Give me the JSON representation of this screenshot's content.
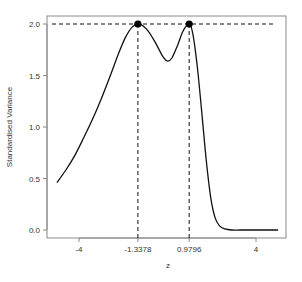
{
  "chart_data": {
    "type": "line",
    "title": "",
    "xlabel": "z",
    "ylabel": "Standardised Variance",
    "xlim": [
      -5.5,
      5.4
    ],
    "ylim": [
      -0.08,
      2.08
    ],
    "x_ticks": [
      -4,
      -1.3378,
      0.9796,
      4
    ],
    "x_tick_labels": [
      "-4",
      "-1.3378",
      "0.9796",
      "4"
    ],
    "y_ticks": [
      0.0,
      0.5,
      1.0,
      1.5,
      2.0
    ],
    "y_tick_labels": [
      "0.0",
      "0.5",
      "1.0",
      "1.5",
      "2.0"
    ],
    "grid": false,
    "legend": null,
    "series": [
      {
        "name": "Standardised Variance",
        "x": [
          -5.0,
          -4.6,
          -4.2,
          -3.8,
          -3.4,
          -3.0,
          -2.6,
          -2.2,
          -1.9,
          -1.6,
          -1.3378,
          -1.1,
          -0.8,
          -0.5,
          -0.2,
          0.0,
          0.2,
          0.45,
          0.7,
          0.9796,
          1.15,
          1.35,
          1.55,
          1.75,
          1.95,
          2.15,
          2.35,
          2.6,
          2.9,
          3.3,
          4.0,
          4.6,
          5.0
        ],
        "y": [
          0.46,
          0.58,
          0.72,
          0.89,
          1.07,
          1.27,
          1.49,
          1.72,
          1.87,
          1.97,
          2.0,
          1.98,
          1.91,
          1.8,
          1.68,
          1.64,
          1.67,
          1.79,
          1.93,
          2.0,
          1.9,
          1.58,
          1.14,
          0.68,
          0.32,
          0.12,
          0.04,
          0.01,
          0.0,
          0.0,
          0.0,
          0.0,
          0.0
        ]
      }
    ],
    "annotations": [
      {
        "type": "point",
        "x": -1.3378,
        "y": 2.0,
        "label": "max 1"
      },
      {
        "type": "point",
        "x": 0.9796,
        "y": 2.0,
        "label": "max 2"
      },
      {
        "type": "hline",
        "y": 2.0,
        "style": "dashed"
      },
      {
        "type": "vline",
        "x": -1.3378,
        "style": "dashed"
      },
      {
        "type": "vline",
        "x": 0.9796,
        "style": "dashed"
      }
    ]
  }
}
